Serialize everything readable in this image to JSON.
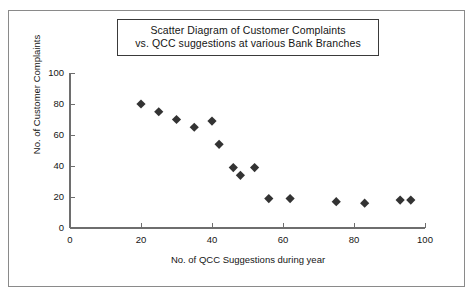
{
  "figure": {
    "title_lines": [
      "Scatter Diagram of Customer Complaints",
      "vs. QCC suggestions at various Bank Branches"
    ],
    "marker_color": "#333333",
    "axis_color": "#6e6e6e",
    "border_color": "#8a8a8a"
  },
  "chart_data": {
    "type": "scatter",
    "title": "Scatter Diagram of Customer Complaints vs. QCC suggestions at various Bank Branches",
    "xlabel": "No. of QCC Suggestions during year",
    "ylabel": "No. of Customer Complaints",
    "xlim": [
      0,
      100
    ],
    "ylim": [
      0,
      100
    ],
    "xticks": [
      0,
      20,
      40,
      60,
      80,
      100
    ],
    "yticks": [
      0,
      20,
      40,
      60,
      80,
      100
    ],
    "xtick_labels": [
      "0",
      "20",
      "40",
      "60",
      "80",
      "100"
    ],
    "ytick_labels": [
      "0",
      "20",
      "40",
      "60",
      "80",
      "100"
    ],
    "grid": false,
    "legend": null,
    "marker": "diamond",
    "points": [
      {
        "x": 20,
        "y": 80
      },
      {
        "x": 25,
        "y": 75
      },
      {
        "x": 30,
        "y": 70
      },
      {
        "x": 35,
        "y": 65
      },
      {
        "x": 40,
        "y": 69
      },
      {
        "x": 42,
        "y": 54
      },
      {
        "x": 46,
        "y": 39
      },
      {
        "x": 48,
        "y": 34
      },
      {
        "x": 52,
        "y": 39
      },
      {
        "x": 56,
        "y": 19
      },
      {
        "x": 62,
        "y": 19
      },
      {
        "x": 75,
        "y": 17
      },
      {
        "x": 83,
        "y": 16
      },
      {
        "x": 93,
        "y": 18
      },
      {
        "x": 96,
        "y": 18
      }
    ]
  }
}
